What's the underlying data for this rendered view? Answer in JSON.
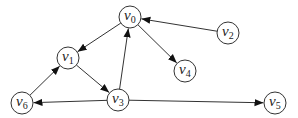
{
  "diagram": {
    "type": "directed-graph",
    "nodes": [
      {
        "id": "v0",
        "base": "v",
        "sub": "0",
        "x": 130,
        "y": 17
      },
      {
        "id": "v1",
        "base": "v",
        "sub": "1",
        "x": 68,
        "y": 58
      },
      {
        "id": "v2",
        "base": "v",
        "sub": "2",
        "x": 228,
        "y": 33
      },
      {
        "id": "v3",
        "base": "v",
        "sub": "3",
        "x": 118,
        "y": 100
      },
      {
        "id": "v4",
        "base": "v",
        "sub": "4",
        "x": 185,
        "y": 71
      },
      {
        "id": "v5",
        "base": "v",
        "sub": "5",
        "x": 275,
        "y": 103
      },
      {
        "id": "v6",
        "base": "v",
        "sub": "6",
        "x": 22,
        "y": 103
      }
    ],
    "edges": [
      {
        "from": "v0",
        "to": "v1"
      },
      {
        "from": "v2",
        "to": "v0"
      },
      {
        "from": "v0",
        "to": "v4"
      },
      {
        "from": "v1",
        "to": "v3"
      },
      {
        "from": "v3",
        "to": "v0"
      },
      {
        "from": "v6",
        "to": "v1"
      },
      {
        "from": "v3",
        "to": "v6"
      },
      {
        "from": "v3",
        "to": "v5"
      }
    ],
    "node_radius": 11,
    "colors": {
      "stroke": "#333333",
      "fill": "#ffffff",
      "text": "#222222"
    }
  }
}
